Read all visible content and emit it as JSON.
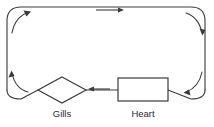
{
  "diagram": {
    "background_color": "#ffffff",
    "line_color": "#3a3a3a",
    "label_color": "#2b2b2b",
    "nodes": [
      {
        "id": "gills",
        "label": "Gills",
        "shape": "diamond",
        "center_x": 62,
        "center_y": 90,
        "half_width": 24,
        "half_height": 13,
        "label_x": 62,
        "label_y": 117
      },
      {
        "id": "heart",
        "label": "Heart",
        "shape": "rectangle",
        "x": 118,
        "y": 78,
        "width": 50,
        "height": 23,
        "label_x": 143,
        "label_y": 117
      }
    ],
    "flow": {
      "direction": "counterclockwise",
      "description": "Blood flows from the heart leftward to the gills, up the left side, across the top to the right, and down the right side back to the heart."
    },
    "arrows": [
      {
        "id": "top-arrow",
        "type": "straight",
        "direction": "right",
        "x1": 96,
        "y1": 10,
        "x2": 124,
        "y2": 10
      },
      {
        "id": "bottom-arrow",
        "type": "straight",
        "direction": "left",
        "x1": 110,
        "y1": 89,
        "x2": 88,
        "y2": 89
      },
      {
        "id": "top-left-corner-arrow",
        "type": "curved",
        "direction": "up-right",
        "path": "M 12 33 C 14 22 20 15 29 12"
      },
      {
        "id": "top-right-corner-arrow",
        "type": "curved",
        "direction": "down-right",
        "path": "M 186 13 C 195 16 200 23 202 33"
      },
      {
        "id": "bottom-left-corner-arrow",
        "type": "curved",
        "direction": "up-left",
        "path": "M 28 92 C 20 90 14 83 12 73"
      },
      {
        "id": "bottom-right-corner-arrow",
        "type": "curved",
        "direction": "down-left",
        "path": "M 202 72 C 200 82 194 89 186 92"
      }
    ],
    "loop": {
      "id": "vessel-loop",
      "description": "Closed rounded-rectangle blood vessel path",
      "corner_radius": 14,
      "left": 7,
      "right": 205,
      "top": 7,
      "bottom": 90
    }
  }
}
